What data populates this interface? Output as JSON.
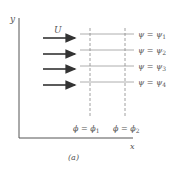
{
  "figure": {
    "caption": "(a)",
    "axis_x_label": "x",
    "axis_y_label": "y",
    "flow_label": "U",
    "streamlines": [
      {
        "label": "ψ = ψ",
        "sub": "1"
      },
      {
        "label": "ψ = ψ",
        "sub": "2"
      },
      {
        "label": "ψ = ψ",
        "sub": "3"
      },
      {
        "label": "ψ = ψ",
        "sub": "4"
      }
    ],
    "potential_lines": [
      {
        "label": "ϕ = ϕ",
        "sub": "1"
      },
      {
        "label": "ϕ = ϕ",
        "sub": "2"
      }
    ],
    "colors": {
      "axis": "#555555",
      "arrow": "#333333",
      "streamline": "#999999",
      "potential": "#888888"
    }
  }
}
